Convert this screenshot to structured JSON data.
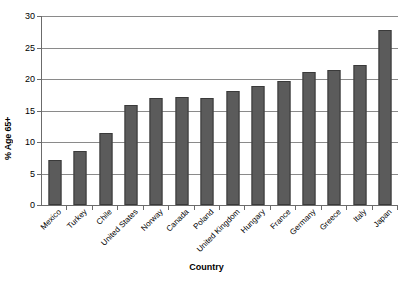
{
  "chart_data": {
    "type": "bar",
    "title": "",
    "xlabel": "Country",
    "ylabel": "% Age 65+",
    "ylim": [
      0,
      30
    ],
    "yticks": [
      0,
      5,
      10,
      15,
      20,
      25,
      30
    ],
    "ytick_labels": [
      "0",
      "5",
      "10",
      "15",
      "20",
      "25",
      "30"
    ],
    "grid": true,
    "legend": false,
    "legend_position": "none",
    "bar_color": "#5b5b5b",
    "bar_edge_color": "#3a3a3a",
    "gridline_color": "#8a8a8a",
    "axis_color": "#6b6b6b",
    "categories": [
      "Mexico",
      "Turkey",
      "Chile",
      "United States",
      "Norway",
      "Canada",
      "Poland",
      "United Kingdom",
      "Hungary",
      "France",
      "Germany",
      "Greece",
      "Italy",
      "Japan"
    ],
    "values": [
      7.1,
      8.6,
      11.4,
      15.9,
      17.0,
      17.1,
      17.0,
      18.1,
      18.9,
      19.7,
      21.1,
      21.5,
      22.3,
      27.8
    ]
  }
}
